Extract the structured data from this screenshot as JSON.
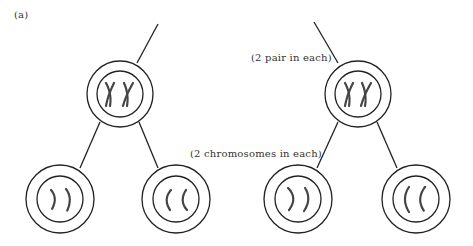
{
  "figure": {
    "panel_label": "(a)",
    "annotations": {
      "pair_label": "(2 pair in each)",
      "chromosome_label": "(2 chromosomes in each)"
    },
    "colors": {
      "stroke": "#222222",
      "chromosome": "#444444",
      "text": "#333333",
      "background": "#ffffff"
    },
    "trees": [
      {
        "name": "left-tree",
        "parent": {
          "cx": 120,
          "cy": 94,
          "content": "two-X-shaped-chromosomes"
        },
        "children": [
          {
            "cx": 60,
            "cy": 199,
            "content": "two-right-curved-chromatids"
          },
          {
            "cx": 176,
            "cy": 199,
            "content": "two-left-curved-chromatids"
          }
        ]
      },
      {
        "name": "right-tree",
        "parent": {
          "cx": 358,
          "cy": 94,
          "content": "two-X-shaped-chromosomes"
        },
        "children": [
          {
            "cx": 298,
            "cy": 199,
            "content": "two-right-curved-chromatids"
          },
          {
            "cx": 416,
            "cy": 199,
            "content": "two-left-curved-chromatids"
          }
        ]
      }
    ]
  }
}
